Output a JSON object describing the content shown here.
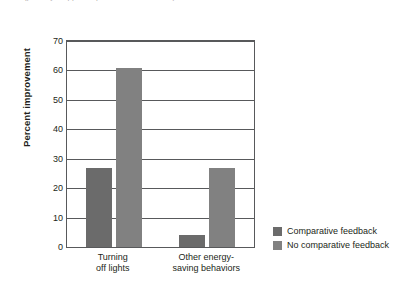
{
  "caption": {
    "clipped_text_fragment": "(partially cropped caption text above chart)"
  },
  "chart_data": {
    "type": "bar",
    "title": "",
    "xlabel": "",
    "ylabel": "Percent improvement",
    "categories": [
      "Turning\noff lights",
      "Other energy-\nsaving behaviors"
    ],
    "series": [
      {
        "name": "Comparative feedback",
        "values": [
          27,
          4
        ],
        "color": "#6b6b6b"
      },
      {
        "name": "No comparative feedback",
        "values": [
          61,
          27
        ],
        "color": "#818181"
      }
    ],
    "ylim": [
      0,
      70
    ],
    "yticks": [
      0,
      10,
      20,
      30,
      40,
      50,
      60,
      70
    ],
    "grid": true,
    "legend_position": "right"
  },
  "legend": {
    "items": [
      {
        "label": "Comparative feedback",
        "color": "#6b6b6b"
      },
      {
        "label": "No comparative feedback",
        "color": "#818181"
      }
    ]
  }
}
